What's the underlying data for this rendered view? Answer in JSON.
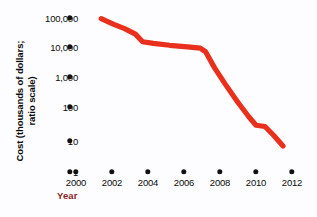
{
  "chart_data": {
    "type": "line",
    "title": "",
    "subtitle": "",
    "xlabel": "Year",
    "ylabel": "Cost (thousands of dollars; ratio scale)",
    "ylabel_lines": [
      "Cost (thousands of dollars;",
      "ratio scale)"
    ],
    "grid": false,
    "legend": false,
    "legend_position": "none",
    "yscale": "log",
    "ylim": [
      1,
      100000
    ],
    "xlim": [
      2000,
      2012
    ],
    "ytick_labels": [
      "100,000",
      "10,000",
      "1,000",
      "100",
      "10",
      "1"
    ],
    "ytick_values": [
      100000,
      10000,
      1000,
      100,
      10,
      1
    ],
    "xtick_labels": [
      "2000",
      "2002",
      "2004",
      "2006",
      "2008",
      "2010",
      "2012"
    ],
    "xtick_values": [
      2000,
      2002,
      2004,
      2006,
      2008,
      2010,
      2012
    ],
    "series": [
      {
        "name": "Cost per genome",
        "color": "#e8301c",
        "x": [
          2001.4,
          2002.1,
          2002.7,
          2003.3,
          2003.7,
          2004.3,
          2005.2,
          2006.2,
          2006.9,
          2007.2,
          2007.7,
          2008.3,
          2009.0,
          2009.6,
          2010.0,
          2010.5,
          2011.0,
          2011.5
        ],
        "y": [
          95000,
          62000,
          45000,
          30000,
          17000,
          15000,
          13000,
          11500,
          10500,
          8000,
          2400,
          700,
          180,
          62,
          33,
          30,
          15,
          7
        ]
      }
    ],
    "annotations": []
  },
  "axis": {
    "y_title_line1": "Cost (thousands of dollars;",
    "y_title_line2": "ratio scale)",
    "x_title": "Year"
  },
  "colors": {
    "series_red": "#e8301c",
    "axis_text": "#0b0b0b",
    "x_title": "#8c1f28",
    "tick_dot": "#111111",
    "background": "#fdfdff"
  }
}
